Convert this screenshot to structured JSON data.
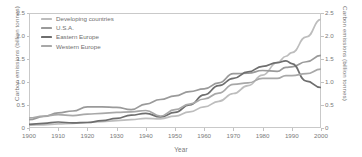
{
  "chart_data": {
    "type": "line",
    "title": "",
    "xlabel": "Year",
    "ylabel": "Carbon emissions (billion tonnes)",
    "ylabel_right": "Carbon emissions (billion tonnes)",
    "xlim": [
      1900,
      2000
    ],
    "ylim": [
      0,
      2.5
    ],
    "grid": false,
    "legend_position": "top-left",
    "xticks": [
      1900,
      1910,
      1920,
      1930,
      1940,
      1950,
      1960,
      1970,
      1980,
      1990,
      2000
    ],
    "yticks": [
      0,
      0.5,
      1.0,
      1.5,
      2.0,
      2.5
    ],
    "ytick_labels": [
      "0",
      "0.5",
      "1.0",
      "1.5",
      "2.0",
      "2.5"
    ],
    "ytick_labels_right": [
      "0",
      "0.5",
      "1.0",
      "1.5",
      "2.0",
      "2.5"
    ],
    "x": [
      1900,
      1905,
      1910,
      1915,
      1920,
      1925,
      1930,
      1935,
      1940,
      1945,
      1950,
      1955,
      1960,
      1965,
      1970,
      1975,
      1980,
      1985,
      1988,
      1990,
      1995,
      2000
    ],
    "series": [
      {
        "name": "Developing countries",
        "color": "#bdbdbd",
        "values": [
          0.06,
          0.07,
          0.09,
          0.1,
          0.12,
          0.14,
          0.16,
          0.18,
          0.21,
          0.2,
          0.26,
          0.35,
          0.46,
          0.58,
          0.75,
          0.92,
          1.15,
          1.42,
          1.56,
          1.64,
          1.98,
          2.36
        ]
      },
      {
        "name": "U.S.A.",
        "color": "#9a9a9a",
        "values": [
          0.18,
          0.25,
          0.33,
          0.37,
          0.46,
          0.46,
          0.45,
          0.4,
          0.52,
          0.62,
          0.7,
          0.79,
          0.85,
          0.98,
          1.18,
          1.19,
          1.25,
          1.23,
          1.32,
          1.33,
          1.44,
          1.58
        ]
      },
      {
        "name": "Eastern Europe",
        "color": "#6e6e6e",
        "values": [
          0.08,
          0.1,
          0.13,
          0.11,
          0.12,
          0.16,
          0.21,
          0.28,
          0.32,
          0.24,
          0.34,
          0.5,
          0.72,
          0.92,
          1.08,
          1.22,
          1.34,
          1.42,
          1.46,
          1.4,
          1.02,
          0.88
        ]
      },
      {
        "name": "Western Europe",
        "color": "#a8a8a8",
        "values": [
          0.22,
          0.26,
          0.29,
          0.27,
          0.3,
          0.32,
          0.34,
          0.35,
          0.38,
          0.26,
          0.4,
          0.52,
          0.63,
          0.76,
          0.95,
          0.98,
          1.08,
          1.08,
          1.14,
          1.14,
          1.18,
          1.28
        ]
      }
    ]
  },
  "legend": {
    "items": [
      {
        "label": "Developing countries",
        "color": "#bdbdbd"
      },
      {
        "label": "U.S.A.",
        "color": "#9a9a9a"
      },
      {
        "label": "Eastern Europe",
        "color": "#6e6e6e"
      },
      {
        "label": "Western Europe",
        "color": "#a8a8a8"
      }
    ]
  },
  "colors": {
    "frame": "#c9c9c9",
    "text": "#7a7a7a",
    "background": "#ffffff"
  }
}
